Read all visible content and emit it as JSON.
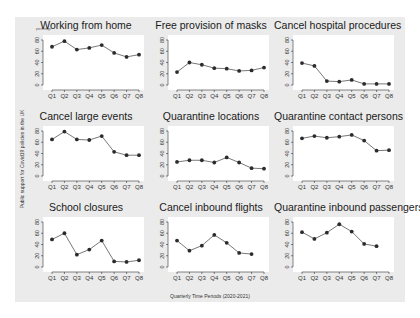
{
  "chart_data": {
    "type": "line",
    "layout": "3x3 small multiples",
    "ylabel": "Public support for Covid19 policies in the UK",
    "xlabel": "Quarterly Time Periods (2020-2021)",
    "corner_label": "percentage",
    "categories": [
      "Q1",
      "Q2",
      "Q3",
      "Q4",
      "Q5",
      "Q6",
      "Q7",
      "Q8"
    ],
    "yticks": [
      0,
      20,
      40,
      60,
      80
    ],
    "ylim": [
      0,
      80
    ],
    "grid": false,
    "panels": [
      {
        "title": "Working from home",
        "values": [
          68,
          78,
          63,
          66,
          71,
          57,
          50,
          54
        ]
      },
      {
        "title": "Free provision of masks",
        "values": [
          23,
          40,
          36,
          30,
          29,
          25,
          26,
          31
        ]
      },
      {
        "title": "Cancel hospital procedures",
        "values": [
          39,
          34,
          7,
          6,
          9,
          2,
          2,
          2
        ]
      },
      {
        "title": "Cancel large events",
        "values": [
          65,
          79,
          65,
          64,
          71,
          43,
          37,
          37
        ]
      },
      {
        "title": "Quarantine locations",
        "values": [
          25,
          28,
          28,
          24,
          33,
          24,
          14,
          13
        ]
      },
      {
        "title": "Quarantine contact persons",
        "values": [
          67,
          71,
          68,
          70,
          73,
          63,
          45,
          46
        ]
      },
      {
        "title": "School closures",
        "values": [
          49,
          60,
          22,
          31,
          47,
          10,
          9,
          12
        ]
      },
      {
        "title": "Cancel inbound flights",
        "values": [
          47,
          29,
          38,
          57,
          43,
          25,
          23,
          null
        ]
      },
      {
        "title": "Quarantine inbound passengers",
        "values": [
          62,
          50,
          61,
          76,
          63,
          41,
          37,
          null
        ]
      }
    ]
  },
  "colors": {
    "background": "#ebebeb",
    "plot_area": "#ffffff",
    "line": "#555555",
    "marker": "#2b2b2b",
    "axis": "#333333"
  }
}
